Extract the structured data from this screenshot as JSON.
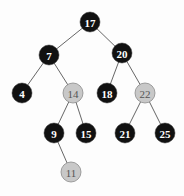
{
  "diagram": {
    "type": "red-black-tree",
    "colors": {
      "black_fill": "#111111",
      "black_text": "#ffffff",
      "red_fill": "#c8c8c8",
      "red_stroke": "#8a8a8a",
      "red_text": "#555555",
      "edge": "#555555"
    },
    "nodes": [
      {
        "id": "n17",
        "label": "17",
        "color": "black",
        "x": 90,
        "y": 22
      },
      {
        "id": "n7",
        "label": "7",
        "color": "black",
        "x": 49,
        "y": 55
      },
      {
        "id": "n20",
        "label": "20",
        "color": "black",
        "x": 122,
        "y": 53
      },
      {
        "id": "n4",
        "label": "4",
        "color": "black",
        "x": 22,
        "y": 93
      },
      {
        "id": "n14",
        "label": "14",
        "color": "red",
        "x": 73,
        "y": 93
      },
      {
        "id": "n18",
        "label": "18",
        "color": "black",
        "x": 107,
        "y": 93
      },
      {
        "id": "n22",
        "label": "22",
        "color": "red",
        "x": 145,
        "y": 93
      },
      {
        "id": "n9",
        "label": "9",
        "color": "black",
        "x": 54,
        "y": 133
      },
      {
        "id": "n15",
        "label": "15",
        "color": "black",
        "x": 86,
        "y": 133
      },
      {
        "id": "n21",
        "label": "21",
        "color": "black",
        "x": 125,
        "y": 133
      },
      {
        "id": "n25",
        "label": "25",
        "color": "black",
        "x": 165,
        "y": 133
      },
      {
        "id": "n11",
        "label": "11",
        "color": "red",
        "x": 71,
        "y": 172
      }
    ],
    "edges": [
      {
        "from": "n17",
        "to": "n7"
      },
      {
        "from": "n17",
        "to": "n20"
      },
      {
        "from": "n7",
        "to": "n4"
      },
      {
        "from": "n7",
        "to": "n14"
      },
      {
        "from": "n20",
        "to": "n18"
      },
      {
        "from": "n20",
        "to": "n22"
      },
      {
        "from": "n14",
        "to": "n9"
      },
      {
        "from": "n14",
        "to": "n15"
      },
      {
        "from": "n22",
        "to": "n21"
      },
      {
        "from": "n22",
        "to": "n25"
      },
      {
        "from": "n9",
        "to": "n11"
      }
    ],
    "node_radius": 10
  }
}
